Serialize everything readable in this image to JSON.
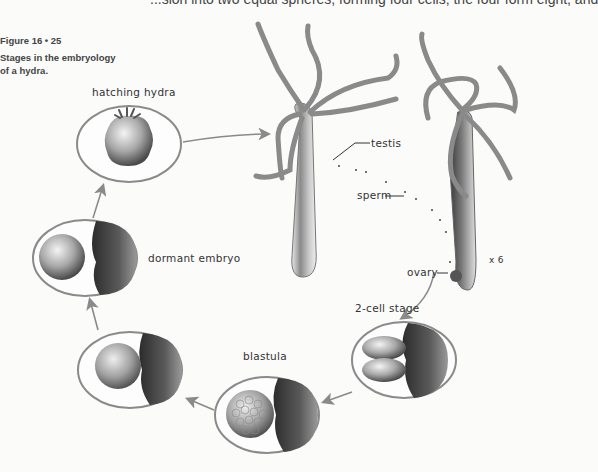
{
  "page": {
    "top_line_fragment": "...sion into two equal spheres, forming four cells; the four form eight, and"
  },
  "figure": {
    "number": "Figure 16 • 25",
    "caption_line1": "Stages in the embryology",
    "caption_line2": "of a hydra.",
    "magnification": "x 6"
  },
  "stages": [
    {
      "id": "hatching",
      "label": "hatching hydra"
    },
    {
      "id": "dormant",
      "label": "dormant embryo"
    },
    {
      "id": "blastula",
      "label": "blastula"
    },
    {
      "id": "two-cell",
      "label": "2-cell stage"
    }
  ],
  "anatomy_labels": {
    "testis": "testis",
    "sperm": "sperm",
    "ovary": "ovary"
  },
  "colors": {
    "background": "#fbfbfa",
    "ellipse_stroke": "#8a8a8a",
    "arrow": "#8a8a8a",
    "body_dark": "#3a3a3a",
    "body_light": "#d8d8d8"
  }
}
